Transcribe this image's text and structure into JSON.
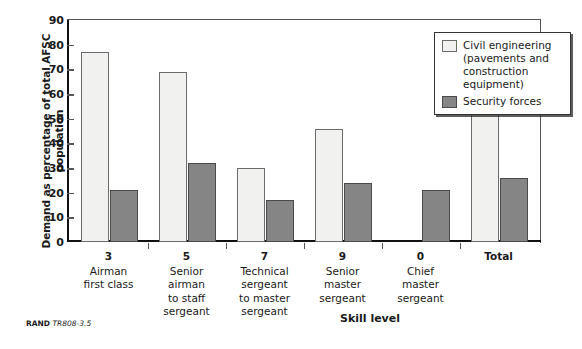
{
  "chart_data": {
    "type": "bar",
    "title": "",
    "subtitle": "",
    "xlabel": "Skill level",
    "ylabel": "Demand as percentage of total AFSC population",
    "ylim": [
      0,
      90
    ],
    "ytick_step": 10,
    "yticks": [
      "90",
      "80",
      "70",
      "60",
      "50",
      "40",
      "30",
      "20",
      "10",
      "0"
    ],
    "grid": false,
    "legend_position": "top-right",
    "categories": [
      {
        "code": "3",
        "name": "Airman\nfirst class"
      },
      {
        "code": "5",
        "name": "Senior\nairman\nto staff\nsergeant"
      },
      {
        "code": "7",
        "name": "Technical\nsergeant\nto master\nsergeant"
      },
      {
        "code": "9",
        "name": "Senior\nmaster\nsergeant"
      },
      {
        "code": "0",
        "name": "Chief\nmaster\nsergeant"
      },
      {
        "code": "Total",
        "name": ""
      }
    ],
    "series": [
      {
        "name": "Civil engineering (pavements and construction equipment)",
        "color": "#f1f1ef",
        "border_color": "#6b6b6b",
        "values": [
          77,
          69,
          30,
          46,
          null,
          58
        ]
      },
      {
        "name": "Security forces",
        "color": "#858585",
        "border_color": "#4a4a4a",
        "values": [
          21,
          32,
          17,
          24,
          21,
          26
        ]
      }
    ]
  },
  "legend": {
    "items": [
      {
        "label": "Civil engineering (pavements and construction equipment)",
        "swatch": "light"
      },
      {
        "label": "Security forces",
        "swatch": "dark"
      }
    ]
  },
  "footer": {
    "brand": "RAND",
    "doc": "TR808-3.5"
  }
}
